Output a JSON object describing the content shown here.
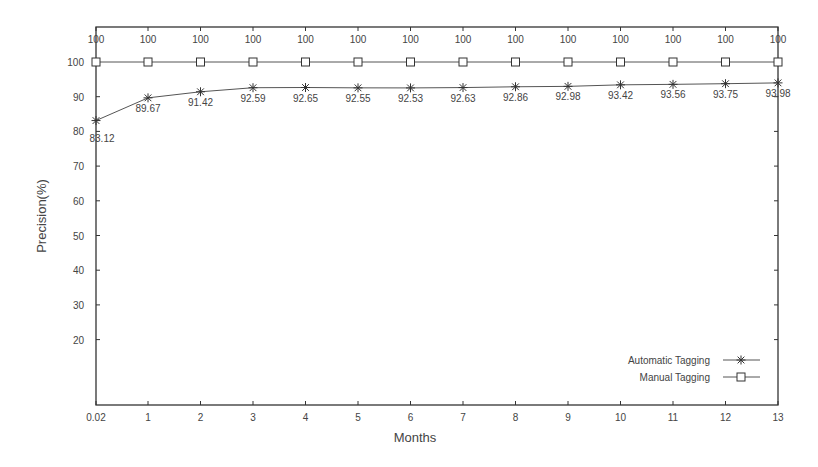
{
  "chart_data": {
    "type": "line",
    "title": "",
    "xlabel": "Months",
    "ylabel": "Precision(%)",
    "x": [
      0.02,
      1,
      2,
      3,
      4,
      5,
      6,
      7,
      8,
      9,
      10,
      11,
      12,
      13
    ],
    "x_tick_labels": [
      "0.02",
      "1",
      "2",
      "3",
      "4",
      "5",
      "6",
      "7",
      "8",
      "9",
      "10",
      "11",
      "12",
      "13"
    ],
    "y_ticks": [
      20,
      30,
      40,
      50,
      60,
      70,
      80,
      90,
      100
    ],
    "y_tick_labels": [
      "20",
      "30",
      "40",
      "50",
      "60",
      "70",
      "80",
      "90",
      "100"
    ],
    "xlim": [
      0.02,
      13
    ],
    "ylim": [
      0,
      110
    ],
    "grid": false,
    "legend_position": "lower right",
    "series": [
      {
        "name": "Automatic Tagging",
        "marker": "asterisk",
        "values": [
          83.12,
          89.67,
          91.42,
          92.59,
          92.65,
          92.55,
          92.53,
          92.63,
          92.86,
          92.98,
          93.42,
          93.56,
          93.75,
          93.98
        ],
        "labels": [
          "83.12",
          "89.67",
          "91.42",
          "92.59",
          "92.65",
          "92.55",
          "92.53",
          "92.63",
          "92.86",
          "92.98",
          "93.42",
          "93.56",
          "93.75",
          "93.98"
        ]
      },
      {
        "name": "Manual Tagging",
        "marker": "square",
        "values": [
          100,
          100,
          100,
          100,
          100,
          100,
          100,
          100,
          100,
          100,
          100,
          100,
          100,
          100
        ],
        "labels": [
          "100",
          "100",
          "100",
          "100",
          "100",
          "100",
          "100",
          "100",
          "100",
          "100",
          "100",
          "100",
          "100",
          "100"
        ]
      }
    ]
  },
  "colors": {
    "axis": "#333333",
    "line": "#555555",
    "text": "#444444"
  }
}
